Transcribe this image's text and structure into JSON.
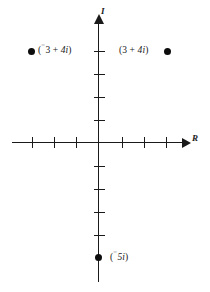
{
  "figure": {
    "kind": "complex-plane-argand-diagram",
    "background_color": "#ffffff",
    "ink_color": "#1a1a1a"
  },
  "axes": {
    "real": {
      "label": "R",
      "name": "real-axis",
      "orientation": "horizontal",
      "arrow": "right",
      "ticks_negative": 3,
      "ticks_positive": 3,
      "tick_values": [
        -3,
        -2,
        -1,
        1,
        2,
        3
      ]
    },
    "imaginary": {
      "label": "I",
      "name": "imaginary-axis",
      "orientation": "vertical",
      "arrow": "up",
      "ticks_positive": 4,
      "ticks_negative": 4,
      "tick_values": [
        4,
        3,
        2,
        1,
        -1,
        -2,
        -3,
        -4
      ]
    }
  },
  "points": [
    {
      "id": "point-neg3-plus-4i",
      "label": "(⁻3 + 4i)",
      "label_prefix": "(",
      "label_neg_sign": "⁻",
      "label_real": "3",
      "label_operator": " + ",
      "label_imag": "4i",
      "label_suffix": ")",
      "real": -3,
      "imaginary": 4,
      "label_side": "right-of-dot"
    },
    {
      "id": "point-3-plus-4i",
      "label": "(3 + 4i)",
      "label_prefix": "(",
      "label_real": "3",
      "label_operator": " + ",
      "label_imag": "4i",
      "label_suffix": ")",
      "real": 3,
      "imaginary": 4,
      "label_side": "left-of-dot"
    },
    {
      "id": "point-neg5i",
      "label": "(⁻5i)",
      "label_prefix": "(",
      "label_neg_sign": "⁻",
      "label_real": "",
      "label_imag": "5i",
      "label_suffix": ")",
      "real": 0,
      "imaginary": -5,
      "label_side": "right-of-dot"
    }
  ],
  "labels": {
    "left_point": {
      "open": "(",
      "neg": "⁻",
      "num": "3",
      "op": " + ",
      "imag": "4i",
      "close": ")"
    },
    "right_point": {
      "open": "(",
      "num": "3",
      "op": " + ",
      "imag": "4i",
      "close": ")"
    },
    "bottom_point": {
      "open": "(",
      "neg": "⁻",
      "imag": "5i",
      "close": ")"
    }
  }
}
